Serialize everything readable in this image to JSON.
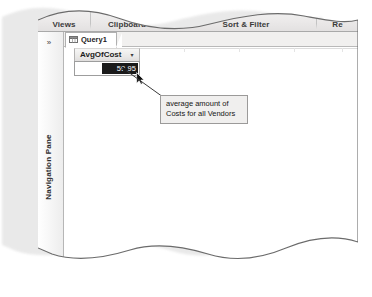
{
  "figure": {
    "style": "torn-paper-excerpt",
    "application": "Microsoft Access datasheet view"
  },
  "ribbon": {
    "groups": [
      {
        "label": "Views",
        "has_launcher": false
      },
      {
        "label": "Clipboard",
        "has_launcher": true,
        "launcher_icon": "dialog-box-launcher-icon"
      },
      {
        "label": "Sort & Filter",
        "has_launcher": false
      },
      {
        "label": "Re",
        "has_launcher": false,
        "truncated": true
      }
    ]
  },
  "navigation_pane": {
    "label": "Navigation Pane",
    "expand_icon": "»",
    "collapsed": true
  },
  "document_tabs": [
    {
      "label": "Query1",
      "icon": "query-datasheet-icon",
      "active": true
    }
  ],
  "datasheet": {
    "columns": [
      {
        "header": "AvgOfCost",
        "dropdown_icon": "▾"
      }
    ],
    "rows": [
      {
        "value": "59.95",
        "selected": true
      }
    ]
  },
  "callout": {
    "line1": "average amount of",
    "line2": "Costs for all Vendors",
    "points_to": "selected-cell"
  },
  "colors": {
    "callout_fill": "#f0efee",
    "callout_border": "#9b9a99",
    "selection_fill": "#1a1a1a",
    "selection_text": "#ffffff",
    "ribbon_top": "#f3f3f2",
    "ribbon_bottom": "#e2e0e0"
  }
}
